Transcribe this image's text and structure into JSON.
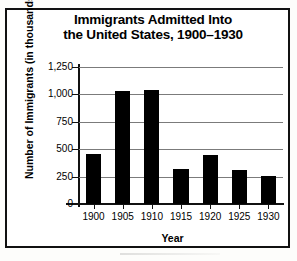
{
  "chart_data": {
    "type": "bar",
    "title": "Immigrants Admitted Into the United States, 1900–1930",
    "title_lines": [
      "Immigrants Admitted Into",
      "the United States, 1900–1930"
    ],
    "xlabel": "Year",
    "ylabel": "Number of Immigrants (in thousands)",
    "categories": [
      "1900",
      "1905",
      "1910",
      "1915",
      "1920",
      "1925",
      "1930"
    ],
    "values": [
      460,
      1030,
      1040,
      320,
      450,
      310,
      260
    ],
    "ylim": [
      0,
      1250
    ],
    "ytick_values": [
      0,
      250,
      500,
      750,
      1000,
      1250
    ],
    "ytick_labels": [
      "0",
      "250",
      "500",
      "750",
      "1,000",
      "1,250"
    ],
    "grid": true,
    "legend": null,
    "bar_color": "#000000",
    "grid_color": "#7b7b7b",
    "axis_color": "#111111"
  }
}
